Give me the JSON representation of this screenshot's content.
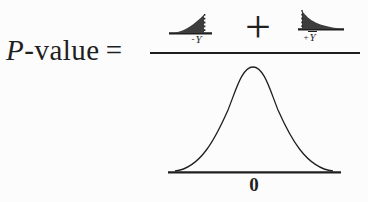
{
  "formula": {
    "lhs": {
      "p_symbol": "P",
      "value_suffix": "-value",
      "equals_sign": "="
    },
    "numerator": {
      "left_tail": {
        "sign": "-",
        "variable": "Y"
      },
      "operator_plus": "+",
      "right_tail": {
        "sign": "+",
        "variable": "Y"
      }
    },
    "denominator": {
      "center_label": "0"
    }
  },
  "colors": {
    "ink": "#1f1f1f",
    "tail_fill": "#3d3d3d",
    "background": "#fcfcfc"
  }
}
